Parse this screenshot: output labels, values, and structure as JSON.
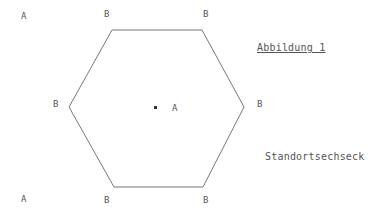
{
  "figure": {
    "title": "Abbildung 1",
    "caption": "Standortsechseck",
    "stroke_color": "#777777",
    "text_color": "#555555"
  },
  "hexagon": {
    "vertices": [
      [
        112,
        30
      ],
      [
        202,
        30
      ],
      [
        244,
        107
      ],
      [
        203,
        187
      ],
      [
        114,
        187
      ],
      [
        69,
        107
      ]
    ],
    "center": [
      155,
      107
    ]
  },
  "labels": [
    {
      "text": "A",
      "x": 21,
      "y": 12,
      "role": "corner-a"
    },
    {
      "text": "B",
      "x": 104,
      "y": 10,
      "role": "vertex-b"
    },
    {
      "text": "B",
      "x": 203,
      "y": 10,
      "role": "vertex-b"
    },
    {
      "text": "B",
      "x": 53,
      "y": 100,
      "role": "vertex-b"
    },
    {
      "text": "A",
      "x": 172,
      "y": 104,
      "role": "center-a"
    },
    {
      "text": "B",
      "x": 257,
      "y": 100,
      "role": "vertex-b"
    },
    {
      "text": "A",
      "x": 21,
      "y": 195,
      "role": "corner-a"
    },
    {
      "text": "B",
      "x": 104,
      "y": 196,
      "role": "vertex-b"
    },
    {
      "text": "B",
      "x": 203,
      "y": 196,
      "role": "vertex-b"
    }
  ]
}
